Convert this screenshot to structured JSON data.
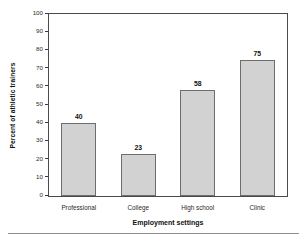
{
  "chart_data": {
    "type": "bar",
    "title": "",
    "categories": [
      "Professional",
      "College",
      "High school",
      "Clinic"
    ],
    "values": [
      40,
      23,
      58,
      75
    ],
    "value_labels": [
      "40",
      "23",
      "58",
      "75"
    ],
    "xlabel": "Employment settings",
    "ylabel": "Percent of athletic trainers",
    "ylim": [
      0,
      100
    ],
    "ytick_labels": [
      "0",
      "10",
      "20",
      "30",
      "40",
      "50",
      "60",
      "70",
      "80",
      "90",
      "100"
    ],
    "ytick_values": [
      0,
      10,
      20,
      30,
      40,
      50,
      60,
      70,
      80,
      90,
      100
    ],
    "grid": false,
    "legend": false,
    "bar_fill_color": "#d2d2d2",
    "bar_border_color": "#6d6d6d",
    "frame_color": "#4a4a4a",
    "text_color": "#111111"
  }
}
